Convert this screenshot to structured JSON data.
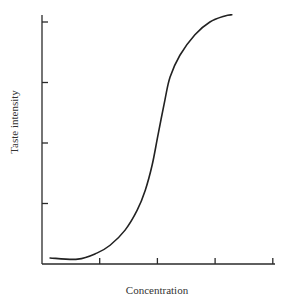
{
  "chart_data": {
    "type": "line",
    "title": "",
    "xlabel": "Concentration",
    "ylabel": "Taste intensity",
    "xlim": [
      0,
      4.1
    ],
    "ylim": [
      0,
      4.2
    ],
    "x_ticks": [
      1,
      2,
      3,
      4
    ],
    "y_ticks": [
      1,
      2,
      3,
      4
    ],
    "x_tick_labels": [],
    "y_tick_labels": [],
    "grid": false,
    "legend": null,
    "series": [
      {
        "name": "taste-response",
        "color": "#222222",
        "x": [
          0.14,
          0.62,
          0.95,
          1.18,
          1.44,
          1.65,
          1.79,
          1.91,
          2.01,
          2.13,
          2.22,
          2.39,
          2.65,
          2.91,
          3.17,
          3.29
        ],
        "y": [
          0.1,
          0.08,
          0.18,
          0.31,
          0.56,
          0.89,
          1.22,
          1.64,
          2.13,
          2.71,
          3.09,
          3.45,
          3.79,
          4.0,
          4.1,
          4.12
        ]
      }
    ]
  }
}
